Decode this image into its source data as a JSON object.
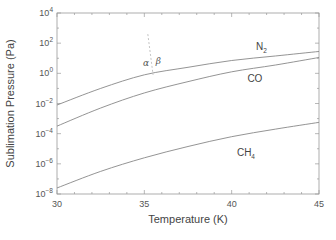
{
  "chart_data": {
    "type": "line",
    "title": "",
    "xlabel": "Temperature (K)",
    "ylabel": "Sublimation Pressure (Pa)",
    "xlim": [
      30,
      45
    ],
    "ylim_log10": [
      -8,
      4
    ],
    "yscale": "log",
    "grid": false,
    "x_ticks": [
      30,
      35,
      40,
      45
    ],
    "x_tick_labels": [
      "30",
      "35",
      "40",
      "45"
    ],
    "y_ticks_log10": [
      4,
      2,
      0,
      -2,
      -4,
      -6,
      -8
    ],
    "y_tick_labels": [
      {
        "base": "10",
        "exp": "4"
      },
      {
        "base": "10",
        "exp": "2"
      },
      {
        "base": "10",
        "exp": "0"
      },
      {
        "base": "10",
        "exp": "-2"
      },
      {
        "base": "10",
        "exp": "-4"
      },
      {
        "base": "10",
        "exp": "-6"
      },
      {
        "base": "10",
        "exp": "-8"
      }
    ],
    "series": [
      {
        "name": "N2",
        "label": "N",
        "label_sub": "2",
        "x": [
          30,
          32.5,
          35,
          37.5,
          40,
          42.5,
          45
        ],
        "log10_y": [
          -2.1,
          -1.0,
          -0.1,
          0.4,
          0.85,
          1.15,
          1.45
        ]
      },
      {
        "name": "CO",
        "label": "CO",
        "label_sub": "",
        "x": [
          30,
          32.5,
          35,
          37.5,
          40,
          42.5,
          45
        ],
        "log10_y": [
          -3.5,
          -2.3,
          -1.3,
          -0.55,
          0.1,
          0.55,
          1.05
        ]
      },
      {
        "name": "CH4",
        "label": "CH",
        "label_sub": "4",
        "x": [
          30,
          32.5,
          35,
          37.5,
          40,
          42.5,
          45
        ],
        "log10_y": [
          -7.6,
          -6.5,
          -5.6,
          -4.85,
          -4.2,
          -3.7,
          -3.25
        ]
      }
    ],
    "annotations": [
      {
        "text": "α",
        "meaning": "alpha phase",
        "x": 35.1,
        "log10_y": 0.5
      },
      {
        "text": "β",
        "meaning": "beta phase",
        "x": 35.8,
        "log10_y": 0.6
      },
      {
        "type": "dashed-line",
        "meaning": "alpha-beta transition of N2",
        "x": [
          35.2,
          35.5
        ],
        "log10_y": [
          2.6,
          -0.1
        ]
      }
    ]
  }
}
